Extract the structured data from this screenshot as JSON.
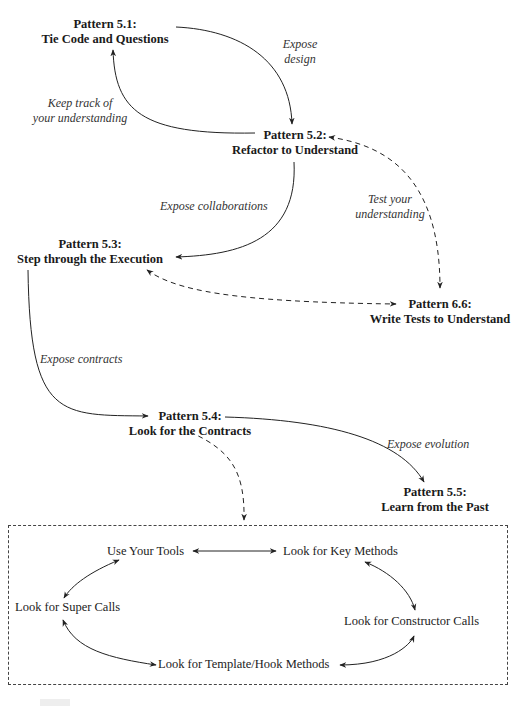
{
  "nodes": {
    "p51": {
      "title": "Pattern 5.1:",
      "name": "Tie Code and Questions"
    },
    "p52": {
      "title": "Pattern 5.2:",
      "name": "Refactor to Understand"
    },
    "p53": {
      "title": "Pattern 5.3:",
      "name": "Step through the Execution"
    },
    "p54": {
      "title": "Pattern 5.4:",
      "name": "Look for the Contracts"
    },
    "p55": {
      "title": "Pattern 5.5:",
      "name": "Learn from the Past"
    },
    "p66": {
      "title": "Pattern 6.6:",
      "name": "Write Tests to Understand"
    }
  },
  "edge_labels": {
    "expose_design": [
      "Expose",
      "design"
    ],
    "keep_track": [
      "Keep track of",
      "your understanding"
    ],
    "expose_collaborations": "Expose collaborations",
    "test_understanding": [
      "Test your",
      "understanding"
    ],
    "expose_contracts": "Expose contracts",
    "expose_evolution": "Expose evolution"
  },
  "subpatterns": {
    "use_tools": "Use Your Tools",
    "key_methods": "Look for Key Methods",
    "super_calls": "Look for Super Calls",
    "constructor_calls": "Look for Constructor Calls",
    "template_hook": "Look for Template/Hook Methods"
  },
  "colors": {
    "line": "#222222",
    "text": "#1a1a1a",
    "label": "#333333"
  }
}
